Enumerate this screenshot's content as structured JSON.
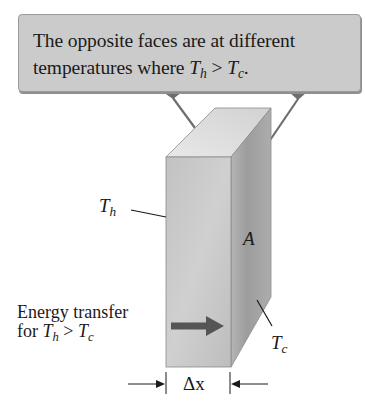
{
  "callout": {
    "line1": "The opposite faces are at different",
    "line2_prefix": "temperatures where ",
    "line2_T1": "T",
    "line2_sub1": "h",
    "line2_op": " > ",
    "line2_T2": "T",
    "line2_sub2": "c",
    "line2_end": "."
  },
  "labels": {
    "hot_face": {
      "T": "T",
      "sub": "h"
    },
    "cold_face": {
      "T": "T",
      "sub": "c"
    },
    "area": "A",
    "thickness": "Δx"
  },
  "energy_note": {
    "line1": "Energy transfer",
    "line2_prefix": "for ",
    "T1": "T",
    "sub1": "h",
    "op": " > ",
    "T2": "T",
    "sub2": "c"
  },
  "colors": {
    "callout_fill": "#cbcbcb",
    "front_face": "#c4c4c4",
    "top_face": "#e0e0e0",
    "right_face": "#a8a8a8",
    "arrow": "#555555",
    "connector": "#6e6e6e"
  }
}
